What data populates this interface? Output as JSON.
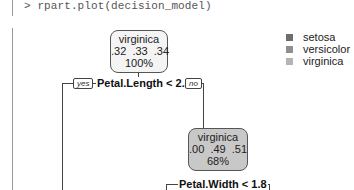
{
  "console": {
    "command": "> rpart.plot(decision_model)"
  },
  "legend": {
    "items": [
      {
        "label": "setosa",
        "color": "#6e6e6e"
      },
      {
        "label": "versicolor",
        "color": "#8e8e8e"
      },
      {
        "label": "virginica",
        "color": "#b4b4b4"
      }
    ]
  },
  "tree": {
    "root": {
      "class": "virginica",
      "probs": ".32  .33  .34",
      "pct": "100%",
      "fill": "#f4f4f4"
    },
    "split1": {
      "label": "Petal.Length < 2.5",
      "yes": "yes",
      "no": "no"
    },
    "node2": {
      "class": "virginica",
      "probs": ".00  .49  .51",
      "pct": "68%",
      "fill": "#c8c8c8"
    },
    "split2": {
      "label": "Petal.Width < 1.8"
    }
  }
}
